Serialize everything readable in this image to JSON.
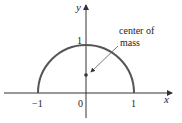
{
  "diagram": {
    "axes": {
      "x_label": "x",
      "y_label": "y"
    },
    "ticks": {
      "x_neg_one": "−1",
      "origin": "0",
      "x_one": "1",
      "y_one": "1"
    },
    "annotation": {
      "line1": "center of",
      "line2": "mass"
    },
    "curve": {
      "type": "semicircle",
      "radius": 1,
      "center": [
        0,
        0
      ],
      "color": "#555555"
    },
    "point": {
      "name": "center of mass",
      "x": 0,
      "y": 0.4
    }
  }
}
